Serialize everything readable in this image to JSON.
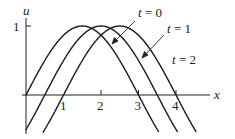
{
  "chart_data": {
    "type": "line",
    "title": "",
    "xlabel": "x",
    "ylabel": "u",
    "x_ticks": [
      "1",
      "2",
      "3",
      "4"
    ],
    "y_ticks": [
      "1"
    ],
    "xlim": [
      -0.05,
      4.9
    ],
    "ylim": [
      -0.55,
      1.1
    ],
    "grid": false,
    "legend": "annotated labels with arrows (upper right)",
    "series": [
      {
        "name": "t = 0",
        "function": "u = cos(pi*(x - 1.5)/3)",
        "x": [
          0,
          0.5,
          1.0,
          1.5,
          2.0,
          2.5,
          3.0,
          3.5
        ],
        "y": [
          0,
          0.5,
          0.87,
          1.0,
          0.87,
          0.5,
          0,
          -0.5
        ]
      },
      {
        "name": "t = 1",
        "function": "u = cos(pi*(x - 2.0)/3)",
        "x": [
          0.5,
          1.0,
          1.5,
          2.0,
          2.5,
          3.0,
          3.5,
          4.0
        ],
        "y": [
          0,
          0.5,
          0.87,
          1.0,
          0.87,
          0.5,
          0,
          -0.5
        ]
      },
      {
        "name": "t = 2",
        "function": "u = cos(pi*(x - 2.5)/3)",
        "x": [
          1.0,
          1.5,
          2.0,
          2.5,
          3.0,
          3.5,
          4.0,
          4.5
        ],
        "y": [
          0,
          0.5,
          0.87,
          1.0,
          0.87,
          0.5,
          0,
          -0.5
        ]
      }
    ]
  },
  "labels": {
    "y_axis": "u",
    "x_axis": "x",
    "y_tick_1": "1",
    "x_tick_1": "1",
    "x_tick_2": "2",
    "x_tick_3": "3",
    "x_tick_4": "4",
    "t0": "t = 0",
    "t1": "t = 1",
    "t2": "t = 2"
  }
}
